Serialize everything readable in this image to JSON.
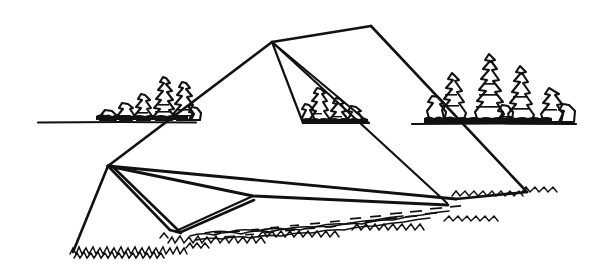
{
  "artwork": {
    "title": "Hang Glider on Grass",
    "medium": "black ink line drawing",
    "background_color": "#ffffff",
    "ink_color": "#111111",
    "canvas": {
      "width": 601,
      "height": 274
    },
    "subject": "a hang glider resting nose-up on a grassy field with a tree line on the horizon"
  },
  "scene": {
    "horizon": {
      "label": "horizon ground line",
      "left_segment": {
        "x1": 38,
        "y1": 122,
        "x2": 196,
        "y2": 122
      },
      "right_segment": {
        "x1": 412,
        "y1": 124,
        "x2": 576,
        "y2": 124
      }
    },
    "tree_groups": [
      {
        "name": "left-tree-cluster",
        "baseline_y": 121,
        "x_start": 96,
        "x_end": 200,
        "tree_count": 7,
        "description": "low conifer cluster left of the glider"
      },
      {
        "name": "center-tree-cluster",
        "baseline_y": 121,
        "x_start": 305,
        "x_end": 368,
        "tree_count": 4,
        "description": "small conifers seen through the open sail"
      },
      {
        "name": "right-tree-cluster",
        "baseline_y": 123,
        "x_start": 424,
        "x_end": 575,
        "tree_count": 7,
        "description": "taller conifer cluster right of the glider"
      }
    ],
    "ground": {
      "label": "grass foreground",
      "tuft_count": 120,
      "shadow_label": "cast shadow under sail"
    }
  },
  "glider": {
    "label": "hang glider",
    "vertices": {
      "nose_apex": {
        "x": 272,
        "y": 42,
        "label": "nose apex / kingpost top"
      },
      "upper_right_corner": {
        "x": 371,
        "y": 26,
        "label": "right leading edge high point"
      },
      "left_wing_vertex": {
        "x": 108,
        "y": 166,
        "label": "left wing junction"
      },
      "left_wing_tip": {
        "x": 73,
        "y": 252,
        "label": "left wingtip on ground"
      },
      "right_wing_tip": {
        "x": 527,
        "y": 192,
        "label": "right wingtip on ground"
      },
      "keel_tail": {
        "x": 456,
        "y": 199,
        "label": "keel tail end"
      },
      "control_bar_base": {
        "x": 176,
        "y": 231,
        "label": "control frame base"
      },
      "cross_brace_joint": {
        "x": 253,
        "y": 196,
        "label": "cross brace joint"
      }
    },
    "members": [
      {
        "name": "left-leading-edge",
        "type": "frame"
      },
      {
        "name": "right-leading-edge",
        "type": "frame"
      },
      {
        "name": "keel-tube",
        "type": "frame"
      },
      {
        "name": "sail-trailing-edge",
        "type": "sail"
      },
      {
        "name": "kingpost-rigging-wire",
        "type": "rig"
      },
      {
        "name": "control-frame-downtube",
        "type": "frame"
      },
      {
        "name": "cross-brace",
        "type": "rig"
      }
    ]
  }
}
